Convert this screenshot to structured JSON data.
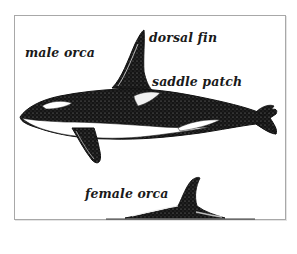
{
  "diagram": {
    "labels": {
      "male": "male orca",
      "dorsal_fin": "dorsal fin",
      "saddle_patch": "saddle patch",
      "female": "female orca"
    },
    "colors": {
      "ink": "#111111",
      "frame": "#a8a8a8",
      "background": "#ffffff"
    }
  }
}
